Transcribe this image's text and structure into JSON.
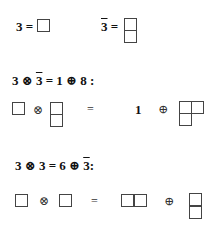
{
  "definitions": {
    "fundamental": {
      "label": "3 =",
      "young_diagram": [
        1
      ]
    },
    "antifundamental": {
      "label_base": "3",
      "label_suffix": " =",
      "young_diagram": [
        1,
        1
      ]
    }
  },
  "products": [
    {
      "heading": "3 ⊗ 3̄ = 1 ⊕ 8 :",
      "lhs": [
        {
          "diagram": [
            1
          ]
        },
        {
          "op": "⊗"
        },
        {
          "diagram": [
            1,
            1
          ]
        }
      ],
      "equals": "=",
      "rhs": [
        {
          "text": "1"
        },
        {
          "op": "⊕"
        },
        {
          "diagram": [
            2,
            1
          ]
        }
      ]
    },
    {
      "heading": "3 ⊗ 3 = 6 ⊕ 3̄ :",
      "lhs": [
        {
          "diagram": [
            1
          ]
        },
        {
          "op": "⊗"
        },
        {
          "diagram": [
            1
          ]
        }
      ],
      "equals": "=",
      "rhs": [
        {
          "diagram": [
            2
          ]
        },
        {
          "op": "⊕"
        },
        {
          "diagram": [
            1,
            1
          ]
        }
      ]
    }
  ],
  "symbols": {
    "otimes": "⊗",
    "oplus": "⊕",
    "equals": "=",
    "colon": ":"
  },
  "text": {
    "three": "3",
    "eq": "=",
    "one": "1",
    "eight": "8",
    "six": "6",
    "h1_a": "3 ⊗ ",
    "h1_b": "3",
    "h1_c": " = 1 ⊕ 8 :",
    "h2_a": "3 ⊗ 3  =  6 ⊕ ",
    "h2_b": "3",
    "h2_c": ":"
  }
}
